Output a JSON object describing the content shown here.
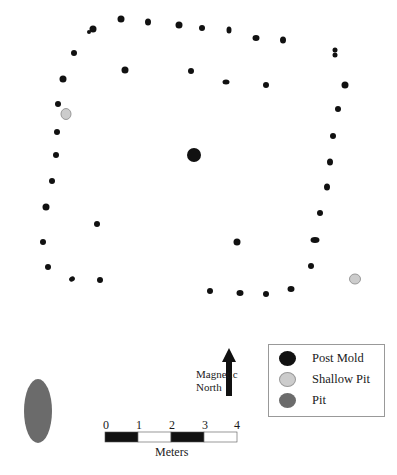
{
  "colors": {
    "post_mold": "#111111",
    "shallow_pit": "#cccccc",
    "shallow_pit_stroke": "#999999",
    "pit": "#6b6b6b"
  },
  "post_molds": [
    {
      "x": 93,
      "y": 29,
      "rx": 3.5,
      "ry": 3.5
    },
    {
      "x": 89,
      "y": 32,
      "rx": 2,
      "ry": 2
    },
    {
      "x": 121,
      "y": 19,
      "rx": 3.5,
      "ry": 3.5
    },
    {
      "x": 148,
      "y": 22,
      "rx": 3,
      "ry": 3.5
    },
    {
      "x": 179,
      "y": 25,
      "rx": 3.5,
      "ry": 3.5
    },
    {
      "x": 202,
      "y": 28,
      "rx": 3,
      "ry": 3
    },
    {
      "x": 229,
      "y": 30,
      "rx": 2.5,
      "ry": 3.5
    },
    {
      "x": 256,
      "y": 38,
      "rx": 3.5,
      "ry": 3
    },
    {
      "x": 283,
      "y": 40,
      "rx": 3,
      "ry": 3.5
    },
    {
      "x": 335,
      "y": 50,
      "rx": 2.5,
      "ry": 2.5
    },
    {
      "x": 335,
      "y": 55,
      "rx": 2.5,
      "ry": 2.5
    },
    {
      "x": 74,
      "y": 53,
      "rx": 3,
      "ry": 3
    },
    {
      "x": 125,
      "y": 70,
      "rx": 3.5,
      "ry": 3.5
    },
    {
      "x": 191,
      "y": 71,
      "rx": 3,
      "ry": 3
    },
    {
      "x": 226,
      "y": 82,
      "rx": 3.5,
      "ry": 2.5
    },
    {
      "x": 266,
      "y": 85,
      "rx": 3,
      "ry": 3
    },
    {
      "x": 345,
      "y": 85,
      "rx": 3.5,
      "ry": 3.5
    },
    {
      "x": 63,
      "y": 79,
      "rx": 3.5,
      "ry": 3.5
    },
    {
      "x": 338,
      "y": 109,
      "rx": 3,
      "ry": 3
    },
    {
      "x": 58,
      "y": 104,
      "rx": 3,
      "ry": 3
    },
    {
      "x": 333,
      "y": 136,
      "rx": 3,
      "ry": 3
    },
    {
      "x": 57,
      "y": 132,
      "rx": 3,
      "ry": 3
    },
    {
      "x": 56,
      "y": 155,
      "rx": 3,
      "ry": 3
    },
    {
      "x": 330,
      "y": 162,
      "rx": 3,
      "ry": 3.5
    },
    {
      "x": 52,
      "y": 181,
      "rx": 3,
      "ry": 3
    },
    {
      "x": 327,
      "y": 187,
      "rx": 3,
      "ry": 3.5
    },
    {
      "x": 46,
      "y": 207,
      "rx": 3.5,
      "ry": 3.5
    },
    {
      "x": 320,
      "y": 213,
      "rx": 3,
      "ry": 3
    },
    {
      "x": 97,
      "y": 224,
      "rx": 3,
      "ry": 3
    },
    {
      "x": 315,
      "y": 240,
      "rx": 4.5,
      "ry": 3
    },
    {
      "x": 43,
      "y": 242,
      "rx": 3,
      "ry": 3
    },
    {
      "x": 237,
      "y": 242,
      "rx": 3.5,
      "ry": 3.5
    },
    {
      "x": 48,
      "y": 267,
      "rx": 3,
      "ry": 3
    },
    {
      "x": 311,
      "y": 266,
      "rx": 3,
      "ry": 3
    },
    {
      "x": 72,
      "y": 279,
      "rx": 3,
      "ry": 2.5,
      "rot": -35
    },
    {
      "x": 100,
      "y": 280,
      "rx": 3,
      "ry": 3
    },
    {
      "x": 210,
      "y": 291,
      "rx": 3,
      "ry": 3
    },
    {
      "x": 240,
      "y": 293,
      "rx": 3.5,
      "ry": 3
    },
    {
      "x": 266,
      "y": 294,
      "rx": 3,
      "ry": 3
    },
    {
      "x": 291,
      "y": 289,
      "rx": 3.5,
      "ry": 3
    }
  ],
  "center_post": {
    "x": 194,
    "y": 155,
    "rx": 7,
    "ry": 7
  },
  "shallow_pits": [
    {
      "x": 66,
      "y": 114,
      "rx": 5,
      "ry": 5.5
    },
    {
      "x": 355,
      "y": 279,
      "rx": 5.5,
      "ry": 5
    }
  ],
  "pit": {
    "x": 38,
    "y": 411,
    "rx": 14,
    "ry": 32
  },
  "north": {
    "label_line1": "Magnetic",
    "label_line2": "North"
  },
  "scale_bar": {
    "ticks": [
      "0",
      "1",
      "2",
      "3",
      "4"
    ],
    "unit": "Meters"
  },
  "legend": {
    "items": [
      {
        "label": "Post Mold",
        "color": "#111111"
      },
      {
        "label": "Shallow Pit",
        "color": "#cccccc"
      },
      {
        "label": "Pit",
        "color": "#6b6b6b"
      }
    ]
  }
}
